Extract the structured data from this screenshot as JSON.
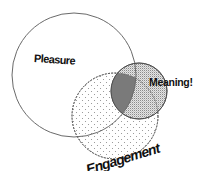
{
  "diagram": {
    "type": "venn",
    "sets": [
      {
        "id": "pleasure",
        "label": "Pleasure",
        "cx": 74,
        "cy": 75,
        "r": 62,
        "fill": "none",
        "stroke": "#6a6a6a"
      },
      {
        "id": "engagement",
        "label": "Engagement",
        "cx": 115,
        "cy": 116,
        "r": 43,
        "fill": "dots-light",
        "stroke": "#6a6a6a"
      },
      {
        "id": "meaning",
        "label": "Meaning!",
        "cx": 139,
        "cy": 91,
        "r": 28,
        "fill": "dots-dense",
        "stroke": "#555555"
      }
    ],
    "overlap": {
      "sets": [
        "pleasure",
        "engagement",
        "meaning"
      ],
      "fill": "#7a7a7a"
    },
    "colors": {
      "background": "#ffffff",
      "outline": "#6a6a6a",
      "text": "#111111",
      "triple_overlap": "#7a7a7a"
    }
  },
  "labels": {
    "pleasure": "Pleasure",
    "meaning": "Meaning!",
    "engagement": "Engagement"
  }
}
